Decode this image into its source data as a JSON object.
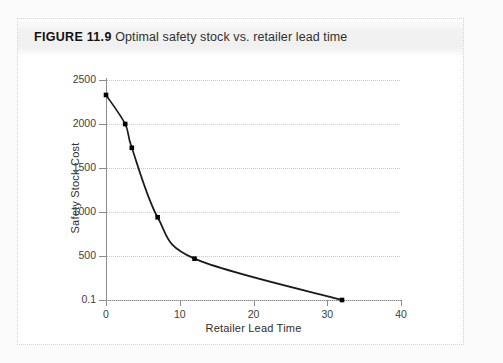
{
  "figure": {
    "label": "FIGURE 11.9",
    "caption": "Optimal safety stock vs. retailer lead time"
  },
  "colors": {
    "line": "#1a1a1a",
    "marker": "#000000",
    "grid": "#c9c9c9",
    "axis": "#8c8c8c",
    "caption_band": "#f0f0f0",
    "page": "#ffffff"
  },
  "chart_data": {
    "type": "line",
    "title": "Optimal safety stock vs. retailer lead time",
    "xlabel": "Retailer Lead Time",
    "ylabel": "Safety Stock Cost",
    "xlim": [
      0,
      40
    ],
    "ylim": [
      0.1,
      2500
    ],
    "xticks": [
      0,
      10,
      20,
      30,
      40
    ],
    "xtick_labels": [
      "0",
      "10",
      "20",
      "30",
      "40"
    ],
    "yticks": [
      0.1,
      500,
      1000,
      1500,
      2000,
      2500
    ],
    "ytick_labels": [
      "0.1",
      "500",
      "1000",
      "1500",
      "2000",
      "2500"
    ],
    "grid": "horizontal-dotted",
    "legend": "none",
    "markers": "filled-square",
    "series": [
      {
        "name": "Safety Stock Cost",
        "x": [
          0,
          2.6,
          3.5,
          7,
          12,
          32
        ],
        "y": [
          2330,
          2000,
          1730,
          940,
          470,
          0.1
        ]
      }
    ]
  }
}
